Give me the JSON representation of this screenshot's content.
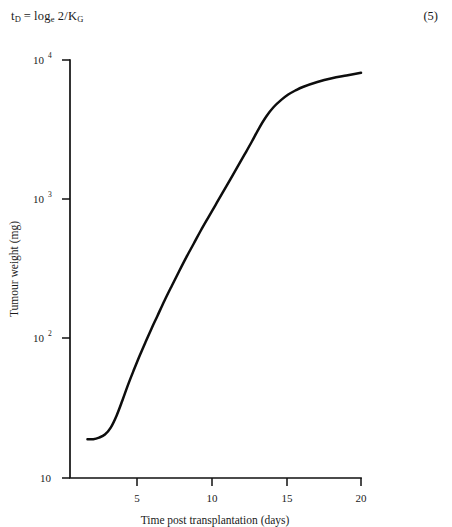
{
  "equation": {
    "lhs_symbol": "t",
    "lhs_subscript": "D",
    "operator": "=",
    "rhs_log": "log",
    "rhs_log_subscript": "e",
    "rhs_rest": "2/K",
    "rhs_rest_subscript": "G",
    "number": "(5)"
  },
  "figure": {
    "y_axis_title": "Tumour weight (mg)",
    "x_axis_title": "Time post transplantation (days)",
    "y_ticks": [
      {
        "label_base": "10",
        "label_exp": "4",
        "value": 10000
      },
      {
        "label_base": "10",
        "label_exp": "3",
        "value": 1000
      },
      {
        "label_base": "10",
        "label_exp": "2",
        "value": 100
      },
      {
        "label_base": "10",
        "label_exp": "",
        "value": 10
      }
    ],
    "x_ticks": [
      {
        "label": "5",
        "value": 5
      },
      {
        "label": "10",
        "value": 10
      },
      {
        "label": "15",
        "value": 15
      },
      {
        "label": "20",
        "value": 20
      }
    ],
    "colors": {
      "curve": "#0d0d0d",
      "axis": "#111111",
      "background": "#ffffff"
    }
  },
  "chart_data": {
    "type": "line",
    "title": "",
    "xlabel": "Time post transplantation (days)",
    "ylabel": "Tumour weight (mg)",
    "xlim": [
      0,
      20
    ],
    "ylim": [
      10,
      10000
    ],
    "yscale": "log",
    "xscale": "linear",
    "grid": false,
    "legend": null,
    "xticks": [
      5,
      10,
      15,
      20
    ],
    "yticks": [
      10,
      100,
      1000,
      10000
    ],
    "ytick_labels": [
      "10",
      "10^2",
      "10^3",
      "10^4"
    ],
    "series": [
      {
        "name": "Tumour growth (Gompertzian)",
        "x": [
          1.2,
          1.6,
          2.0,
          2.4,
          2.8,
          3.2,
          3.6,
          4.0,
          4.4,
          4.8,
          5.2,
          5.6,
          6.0,
          6.5,
          7.0,
          7.5,
          8.0,
          8.5,
          9.0,
          9.5,
          10.0,
          10.5,
          11.0,
          11.5,
          12.0,
          12.5,
          13.0,
          13.5,
          14.0,
          14.5,
          15.0,
          15.5,
          16.0,
          17.0,
          18.0,
          19.0,
          20.0
        ],
        "y": [
          19,
          19,
          19.5,
          20.5,
          23,
          28,
          36,
          47,
          60,
          76,
          95,
          118,
          145,
          188,
          240,
          305,
          385,
          480,
          600,
          740,
          910,
          1120,
          1380,
          1700,
          2100,
          2600,
          3250,
          3950,
          4600,
          5150,
          5650,
          6050,
          6400,
          6950,
          7400,
          7750,
          8100
        ]
      }
    ]
  }
}
